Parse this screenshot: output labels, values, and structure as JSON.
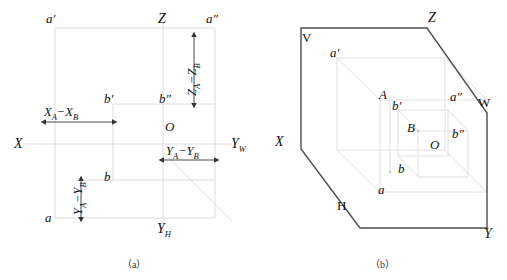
{
  "figure": {
    "captions": [
      {
        "text": "（a）",
        "x": 122,
        "y": 256
      },
      {
        "text": "（b）",
        "x": 370,
        "y": 256
      }
    ]
  },
  "part_a": {
    "name": "three-view-projection-axes",
    "axis_labels": [
      {
        "id": "x-axis",
        "text": "X",
        "x": 14,
        "y": 139
      },
      {
        "id": "z-axis",
        "text": "Z",
        "x": 158,
        "y": 14
      },
      {
        "id": "yw-axis",
        "text": "Y",
        "sub": "W",
        "x": 231,
        "y": 139
      },
      {
        "id": "yh-axis",
        "text": "Y",
        "sub": "H",
        "x": 157,
        "y": 224
      }
    ],
    "points": [
      {
        "id": "a-prime",
        "text": "a′",
        "x": 46,
        "y": 14
      },
      {
        "id": "a-double-prime",
        "text": "a″",
        "x": 206,
        "y": 14
      },
      {
        "id": "b-prime",
        "text": "b′",
        "x": 104,
        "y": 96
      },
      {
        "id": "b-double-prime",
        "text": "b″",
        "x": 159,
        "y": 96
      },
      {
        "id": "origin-o",
        "text": "O",
        "x": 165,
        "y": 123
      },
      {
        "id": "b-point",
        "text": "b",
        "x": 104,
        "y": 172
      },
      {
        "id": "a-point",
        "text": "a",
        "x": 45,
        "y": 213
      }
    ],
    "dimensions": [
      {
        "id": "dx",
        "text": "X",
        "sub1": "A",
        "op": "−",
        "text2": "X",
        "sub2": "B",
        "x": 44,
        "y": 111,
        "orient": "horizontal"
      },
      {
        "id": "dz",
        "text": "Z",
        "sub1": "A",
        "op": "−",
        "text2": "Z",
        "sub2": "B",
        "x": 186,
        "y": 92,
        "orient": "vertical"
      },
      {
        "id": "dy-right",
        "text": "Y",
        "sub1": "A",
        "op": "−",
        "text2": "Y",
        "sub2": "B",
        "x": 166,
        "y": 148,
        "orient": "horizontal"
      },
      {
        "id": "dy-left",
        "text": "Y",
        "sub1": "A",
        "op": "−",
        "text2": "Y",
        "sub2": "B",
        "x": 62,
        "y": 210,
        "orient": "vertical"
      }
    ]
  },
  "part_b": {
    "name": "axonometric-projection-box",
    "plane_labels": [
      {
        "id": "plane-v",
        "text": "V",
        "x": 302,
        "y": 33
      },
      {
        "id": "plane-h",
        "text": "H",
        "x": 337,
        "y": 201
      },
      {
        "id": "plane-w",
        "text": "W",
        "x": 478,
        "y": 98
      }
    ],
    "axis_labels": [
      {
        "id": "x-axis",
        "text": "X",
        "x": 275,
        "y": 137
      },
      {
        "id": "z-axis",
        "text": "Z",
        "x": 428,
        "y": 13
      },
      {
        "id": "y-axis",
        "text": "Y",
        "x": 484,
        "y": 229
      }
    ],
    "points": [
      {
        "id": "a-prime",
        "text": "a′",
        "x": 330,
        "y": 48
      },
      {
        "id": "point-A",
        "text": "A",
        "x": 379,
        "y": 90
      },
      {
        "id": "b-prime",
        "text": "b′",
        "x": 392,
        "y": 101
      },
      {
        "id": "point-B",
        "text": "B",
        "x": 407,
        "y": 123
      },
      {
        "id": "origin-O",
        "text": "O",
        "x": 430,
        "y": 140
      },
      {
        "id": "a-double-prime",
        "text": "a″",
        "x": 450,
        "y": 92
      },
      {
        "id": "b-double-prime",
        "text": "b″",
        "x": 452,
        "y": 129
      },
      {
        "id": "b-point",
        "text": "b",
        "x": 398,
        "y": 164
      },
      {
        "id": "a-point",
        "text": "a",
        "x": 378,
        "y": 185
      }
    ]
  },
  "colors": {
    "outline": "#4d4d4d",
    "construction": "#d8d8d8",
    "text": "#111111"
  }
}
